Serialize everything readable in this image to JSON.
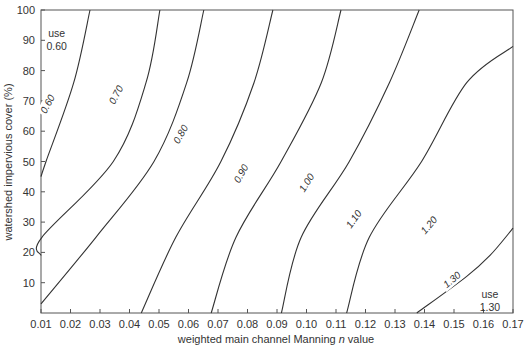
{
  "chart_data": {
    "type": "line",
    "title": "",
    "xlabel": "weighted main channel Manning n value",
    "xlabel_parts": [
      "weighted main channel Manning ",
      "n",
      " value"
    ],
    "ylabel": "watershed impervious cover (%)",
    "xlim": [
      0.01,
      0.17
    ],
    "ylim": [
      0,
      100
    ],
    "grid": false,
    "legend": "none (curves labeled inline)",
    "x_ticks": [
      "0.01",
      "0.02",
      "0.03",
      "0.04",
      "0.05",
      "0.06",
      "0.07",
      "0.08",
      "0.09",
      "0.10",
      "0.11",
      "0.12",
      "0.13",
      "0.14",
      "0.15",
      "0.16",
      "0.17"
    ],
    "y_ticks": [
      "10",
      "20",
      "30",
      "40",
      "50",
      "60",
      "70",
      "80",
      "90",
      "100"
    ],
    "series": [
      {
        "name": "0.60",
        "points": [
          [
            0.01,
            45
          ],
          [
            0.0117,
            50
          ],
          [
            0.0211,
            76
          ],
          [
            0.0266,
            100
          ]
        ],
        "label_at": [
          0.0122,
          69
        ],
        "label_rot": -62
      },
      {
        "name": "0.70",
        "points": [
          [
            0.01,
            19
          ],
          [
            0.0103,
            25
          ],
          [
            0.0345,
            50
          ],
          [
            0.0456,
            76
          ],
          [
            0.0503,
            100
          ]
        ],
        "label_at": [
          0.0354,
          72
        ],
        "label_rot": -62
      },
      {
        "name": "0.80",
        "points": [
          [
            0.01,
            3
          ],
          [
            0.0286,
            25
          ],
          [
            0.0483,
            50
          ],
          [
            0.0594,
            76
          ],
          [
            0.0652,
            100
          ]
        ],
        "label_at": [
          0.0573,
          59
        ],
        "label_rot": -60
      },
      {
        "name": "0.90",
        "points": [
          [
            0.044,
            0
          ],
          [
            0.0557,
            25
          ],
          [
            0.071,
            50
          ],
          [
            0.0822,
            76
          ],
          [
            0.0886,
            100
          ]
        ],
        "label_at": [
          0.0778,
          46
        ],
        "label_rot": -60
      },
      {
        "name": "1.00",
        "points": [
          [
            0.0677,
            0
          ],
          [
            0.0761,
            25
          ],
          [
            0.0914,
            50
          ],
          [
            0.105,
            76
          ],
          [
            0.1117,
            100
          ]
        ],
        "label_at": [
          0.1,
          43
        ],
        "label_rot": -58
      },
      {
        "name": "1.10",
        "points": [
          [
            0.0915,
            0
          ],
          [
            0.0982,
            25
          ],
          [
            0.1145,
            50
          ],
          [
            0.1281,
            76
          ],
          [
            0.1382,
            100
          ]
        ],
        "label_at": [
          0.116,
          31
        ],
        "label_rot": -55
      },
      {
        "name": "1.20",
        "points": [
          [
            0.1136,
            0
          ],
          [
            0.1213,
            25
          ],
          [
            0.139,
            50
          ],
          [
            0.1543,
            76
          ],
          [
            0.17,
            88
          ]
        ],
        "label_at": [
          0.1415,
          29
        ],
        "label_rot": -50
      },
      {
        "name": "1.30",
        "points": [
          [
            0.1374,
            0
          ],
          [
            0.1542,
            12
          ],
          [
            0.1622,
            19
          ],
          [
            0.17,
            28
          ]
        ],
        "label_at": [
          0.1493,
          11
        ],
        "label_rot": -40
      }
    ],
    "annotations": [
      {
        "text_lines": [
          "use",
          "0.60"
        ],
        "x": 0.0153,
        "y": 91
      },
      {
        "text_lines": [
          "use",
          "1.30"
        ],
        "x": 0.1622,
        "y": 5
      }
    ]
  },
  "colors": {
    "curve": "#333333",
    "axis": "#555555",
    "text": "#333333",
    "background": "#ffffff"
  }
}
